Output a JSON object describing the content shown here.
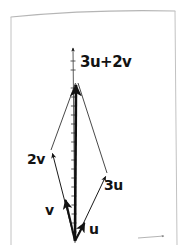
{
  "page": {
    "kind": "hand-drawn-notebook-page",
    "background_color": "#ffffff",
    "ink_color": "#131313",
    "border_color": "#b9b9b9",
    "width": 186,
    "height": 245
  },
  "diagram": {
    "origin": {
      "x": 75,
      "y": 241
    },
    "axes": {
      "vertical": {
        "name": "vertical-axis",
        "from": {
          "x": 75,
          "y": 241
        },
        "to": {
          "x": 73,
          "y": 45
        },
        "arrow": true,
        "tick_count": 19,
        "tick_spacing": 9,
        "tick_width": 5
      },
      "horizontal": {
        "name": "horizontal-axis",
        "from": {
          "x": 75,
          "y": 241
        },
        "to": {
          "x": 166,
          "y": 236
        },
        "arrow": true,
        "visible_portion": "arrowhead-only"
      }
    },
    "vectors": [
      {
        "id": "u",
        "label": "u",
        "label_pos": {
          "x": 89,
          "y": 222
        },
        "from": {
          "x": 75,
          "y": 241
        },
        "to": {
          "x": 86,
          "y": 219
        },
        "stroke_width": 2.1,
        "weight": "heavy",
        "arrow": true
      },
      {
        "id": "v",
        "label": "v",
        "label_pos": {
          "x": 45,
          "y": 203
        },
        "from": {
          "x": 75,
          "y": 241
        },
        "to": {
          "x": 64,
          "y": 196
        },
        "stroke_width": 2.1,
        "weight": "heavy",
        "arrow": true
      },
      {
        "id": "3u",
        "label": "3u",
        "label_pos": {
          "x": 104,
          "y": 178
        },
        "from": {
          "x": 75,
          "y": 241
        },
        "to": {
          "x": 107,
          "y": 173
        },
        "stroke_width": 1.0,
        "weight": "light",
        "arrow": true
      },
      {
        "id": "2v",
        "label": "2v",
        "label_pos": {
          "x": 27,
          "y": 152
        },
        "from": {
          "x": 75,
          "y": 241
        },
        "to": {
          "x": 51,
          "y": 150
        },
        "stroke_width": 1.0,
        "weight": "light",
        "arrow": true
      },
      {
        "id": "3u+2v",
        "label": "3u+2v",
        "label_pos": {
          "x": 80,
          "y": 55
        },
        "from": {
          "x": 75,
          "y": 241
        },
        "to": {
          "x": 76,
          "y": 80
        },
        "stroke_width": 2.6,
        "weight": "heavy",
        "arrow": true
      }
    ],
    "construction_lines": [
      {
        "id": "from-2v-to-sum",
        "from": {
          "x": 51,
          "y": 150
        },
        "to": {
          "x": 76,
          "y": 82
        },
        "stroke_width": 0.9
      },
      {
        "id": "from-3u-to-sum",
        "from": {
          "x": 107,
          "y": 173
        },
        "to": {
          "x": 78,
          "y": 82
        },
        "stroke_width": 0.9
      }
    ]
  },
  "labels": {
    "sum": "3u+2v",
    "two_v": "2v",
    "three_u": "3u",
    "v": "v",
    "u": "u"
  }
}
